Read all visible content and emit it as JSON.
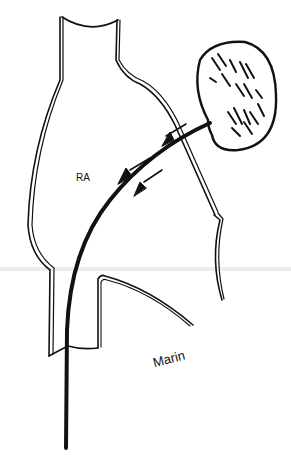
{
  "figure": {
    "labels": {
      "chamber": "RA",
      "signature": "Marin"
    },
    "elements": [
      "superior-vena-cava",
      "right-atrium-outline",
      "inferior-vena-cava",
      "right-atrial-appendage-mass",
      "catheter",
      "flow-arrows"
    ],
    "colors": {
      "ink": "#111111",
      "background": "#ffffff",
      "scan-line": "#e6e6e6"
    }
  }
}
